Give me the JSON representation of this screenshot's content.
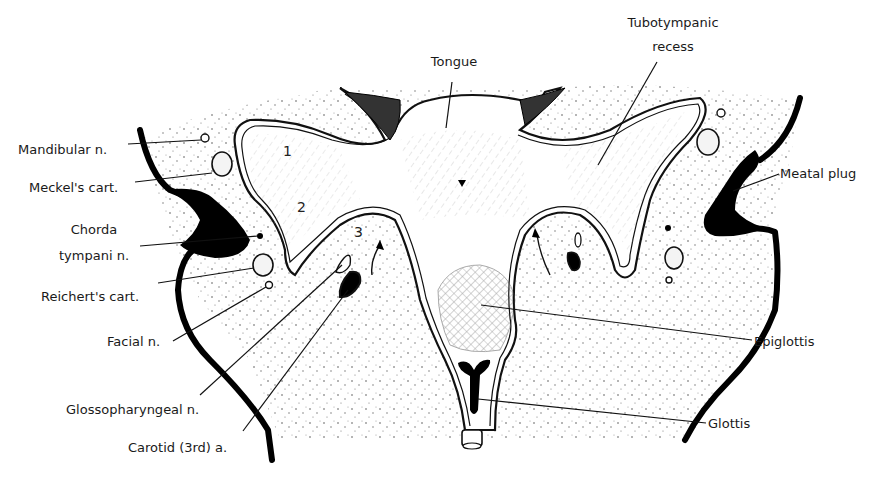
{
  "figure": {
    "labels": {
      "tongue": "Tongue",
      "tubotympanic_line1": "Tubotympanic",
      "tubotympanic_line2": "recess",
      "mandibular_n": "Mandibular n.",
      "meckels_cart": "Meckel's cart.",
      "chorda_line1": "Chorda",
      "chorda_line2": "tympani n.",
      "reicherts_cart": "Reichert's cart.",
      "facial_n": "Facial n.",
      "glossopharyngeal_n": "Glossopharyngeal n.",
      "carotid_a": "Carotid (3rd) a.",
      "meatal_plug": "Meatal plug",
      "epiglottis": "Epiglottis",
      "glottis": "Glottis"
    },
    "pouch_numbers": {
      "first": "1",
      "second": "2",
      "third": "3"
    }
  }
}
